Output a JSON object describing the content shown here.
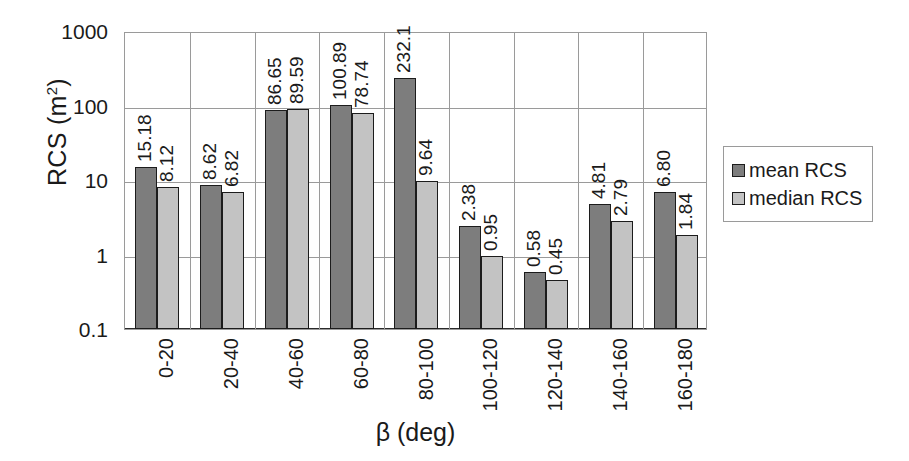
{
  "chart_data": {
    "type": "bar",
    "title": "",
    "xlabel": "β (deg)",
    "ylabel": "RCS (m²)",
    "ylabel_base": "RCS (m",
    "ylabel_sup": "2",
    "ylabel_tail": ")",
    "yscale": "log",
    "ylim": [
      0.1,
      1000
    ],
    "ytick_labels": [
      "1000",
      "100",
      "10",
      "1",
      "0.1"
    ],
    "ytick_values": [
      1000,
      100,
      10,
      1,
      0.1
    ],
    "grid": "horizontal-and-vertical",
    "legend_position": "right",
    "categories": [
      "0-20",
      "20-40",
      "40-60",
      "60-80",
      "80-100",
      "100-120",
      "120-140",
      "140-160",
      "160-180"
    ],
    "series": [
      {
        "name": "mean RCS",
        "color": "#7d7d7d",
        "values": [
          15.18,
          8.62,
          86.65,
          100.89,
          232.1,
          2.38,
          0.58,
          4.81,
          6.8
        ],
        "labels": [
          "15.18",
          "8.62",
          "86.65",
          "100.89",
          "232.1",
          "2.38",
          "0.58",
          "4.81",
          "6.80"
        ]
      },
      {
        "name": "median RCS",
        "color": "#c3c3c3",
        "values": [
          8.12,
          6.82,
          89.59,
          78.74,
          9.64,
          0.95,
          0.45,
          2.79,
          1.84
        ],
        "labels": [
          "8.12",
          "6.82",
          "89.59",
          "78.74",
          "9.64",
          "0.95",
          "0.45",
          "2.79",
          "1.84"
        ]
      }
    ]
  },
  "legend": {
    "items": [
      {
        "label": "mean RCS",
        "color": "#7d7d7d"
      },
      {
        "label": "median RCS",
        "color": "#c3c3c3"
      }
    ]
  }
}
